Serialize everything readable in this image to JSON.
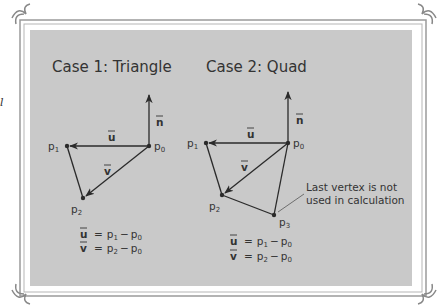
{
  "side_text": "l",
  "case1": {
    "title": "Case 1: Triangle",
    "labels": {
      "p0": "p",
      "p0_sub": "0",
      "p1": "p",
      "p1_sub": "1",
      "p2": "p",
      "p2_sub": "2",
      "u": "u",
      "v": "v",
      "n": "n"
    },
    "equations": [
      {
        "lhs": "u",
        "rhs_a": "p",
        "rhs_a_sub": "1",
        "rhs_b": "p",
        "rhs_b_sub": "0"
      },
      {
        "lhs": "v",
        "rhs_a": "p",
        "rhs_a_sub": "2",
        "rhs_b": "p",
        "rhs_b_sub": "0"
      }
    ]
  },
  "case2": {
    "title": "Case 2: Quad",
    "labels": {
      "p0": "p",
      "p0_sub": "0",
      "p1": "p",
      "p1_sub": "1",
      "p2": "p",
      "p2_sub": "2",
      "p3": "p",
      "p3_sub": "3",
      "u": "u",
      "v": "v",
      "n": "n"
    },
    "annotation": [
      "Last vertex is not",
      "used in calculation"
    ],
    "equations": [
      {
        "lhs": "u",
        "rhs_a": "p",
        "rhs_a_sub": "1",
        "rhs_b": "p",
        "rhs_b_sub": "0"
      },
      {
        "lhs": "v",
        "rhs_a": "p",
        "rhs_a_sub": "2",
        "rhs_b": "p",
        "rhs_b_sub": "0"
      }
    ]
  },
  "symbols": {
    "equals": "=",
    "minus": "−"
  },
  "colors": {
    "panel": "#c9c9c9",
    "ink": "#2a2a2a",
    "frame": "#8a8a8a"
  }
}
